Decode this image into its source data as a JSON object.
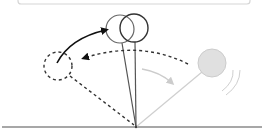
{
  "diagram": {
    "type": "pendulum-motion",
    "colors": {
      "background": "#ffffff",
      "frame": "#d6d6d6",
      "ground": "#8a8a8a",
      "rod_dark": "#555555",
      "rod_light": "#cfcfcf",
      "bob_outline": "#555555",
      "bob_highlight": "#333333",
      "bob_fill_light": "#e0e0e0",
      "bob_stroke_light": "#cccccc",
      "arrow_dark": "#111111",
      "arrow_light": "#cccccc",
      "dashed": "#333333"
    },
    "elements": [
      "top-frame",
      "ground-line",
      "pivot",
      "rod-upright-1",
      "rod-upright-2",
      "bob-upright-1",
      "bob-upright-2",
      "rod-right-light",
      "bob-right-light",
      "motion-lines",
      "dashed-path-to-left",
      "dashed-bob-left",
      "dashed-rod-left",
      "arrow-left-to-top",
      "arrow-right-down"
    ]
  }
}
